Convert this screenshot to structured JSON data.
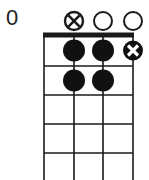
{
  "chord_diagram": {
    "instrument_strings": 4,
    "start_fret_label": "0",
    "colors": {
      "line": "#1a1a1a",
      "dot": "#111111",
      "background": "#ffffff"
    },
    "string_x": [
      44,
      74,
      103,
      133
    ],
    "nut_y": 35,
    "fret_y": [
      66,
      95,
      124,
      153
    ],
    "bottom_y": 180,
    "top_markers": [
      {
        "string": 1,
        "type": "none"
      },
      {
        "string": 2,
        "type": "circle-x"
      },
      {
        "string": 3,
        "type": "open"
      },
      {
        "string": 4,
        "type": "open"
      }
    ],
    "fingered_dots": [
      {
        "string": 2,
        "fret": 1,
        "type": "filled"
      },
      {
        "string": 3,
        "fret": 1,
        "type": "filled"
      },
      {
        "string": 4,
        "fret": 1,
        "type": "filled-x"
      },
      {
        "string": 2,
        "fret": 2,
        "type": "filled"
      },
      {
        "string": 3,
        "fret": 2,
        "type": "filled"
      }
    ]
  }
}
